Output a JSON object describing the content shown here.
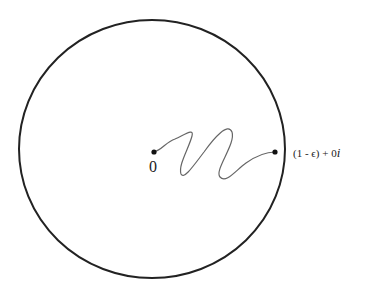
{
  "diagram": {
    "circle": {
      "cx": 152,
      "cy": 149,
      "rx": 133,
      "ry": 129,
      "stroke": "#222222"
    },
    "points": [
      {
        "id": "origin",
        "x": 154,
        "y": 152,
        "label": "0"
      },
      {
        "id": "endpoint",
        "x": 275,
        "y": 152,
        "label": "(1 - ϵ) + 0i"
      }
    ],
    "labels": {
      "origin": "0",
      "endpoint_main": "(1 - ϵ) + 0",
      "endpoint_imag": "i"
    },
    "path_color": "#555555"
  }
}
